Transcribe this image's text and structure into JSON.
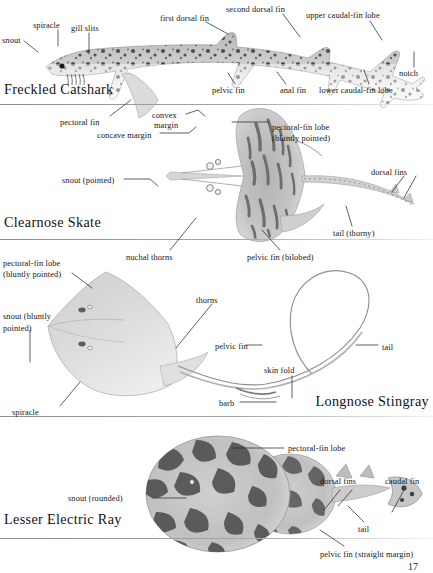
{
  "page": {
    "number": "17",
    "background": "#ffffff",
    "text_color": "#161616",
    "rule_color": "#9a9a9a"
  },
  "panels": [
    {
      "id": "freckled-catshark",
      "species_name": "Freckled Catshark",
      "labels": [
        {
          "text": "snout",
          "x": 2,
          "y": 36
        },
        {
          "text": "spiracle",
          "x": 33,
          "y": 21
        },
        {
          "text": "gill slits",
          "x": 71,
          "y": 24
        },
        {
          "text": "first dorsal fin",
          "x": 160,
          "y": 14
        },
        {
          "text": "second dorsal fin",
          "x": 226,
          "y": 5
        },
        {
          "text": "upper caudal-fin lobe",
          "x": 306,
          "y": 11
        },
        {
          "text": "notch",
          "x": 399,
          "y": 69
        },
        {
          "text": "lower caudal-fin lobe",
          "x": 319,
          "y": 86
        },
        {
          "text": "anal fin",
          "x": 280,
          "y": 86
        },
        {
          "text": "pelvic fin",
          "x": 212,
          "y": 86
        },
        {
          "text": "pectoral fin",
          "x": 60,
          "y": 118
        }
      ]
    },
    {
      "id": "clearnose-skate",
      "species_name": "Clearnose Skate",
      "labels": [
        {
          "text": "convex",
          "x": 152,
          "y": 111
        },
        {
          "text": "margin",
          "x": 154,
          "y": 121
        },
        {
          "text": "concave margin",
          "x": 97,
          "y": 131
        },
        {
          "text": "pectoral-fin lobe",
          "x": 272,
          "y": 123
        },
        {
          "text": "(bluntly pointed)",
          "x": 272,
          "y": 134
        },
        {
          "text": "dorsal fins",
          "x": 371,
          "y": 168
        },
        {
          "text": "snout (pointed)",
          "x": 62,
          "y": 176
        },
        {
          "text": "tail (thorny)",
          "x": 333,
          "y": 229
        },
        {
          "text": "pelvic fin (bilobed)",
          "x": 247,
          "y": 253
        },
        {
          "text": "nuchal thorns",
          "x": 126,
          "y": 253
        }
      ]
    },
    {
      "id": "longnose-stingray",
      "species_name": "Longnose Stingray",
      "labels": [
        {
          "text": "pectoral-fin lobe",
          "x": 3,
          "y": 259
        },
        {
          "text": "(bluntly pointed)",
          "x": 3,
          "y": 270
        },
        {
          "text": "thorns",
          "x": 196,
          "y": 296
        },
        {
          "text": "snout (bluntly",
          "x": 3,
          "y": 312
        },
        {
          "text": "pointed)",
          "x": 3,
          "y": 324
        },
        {
          "text": "pelvic fin",
          "x": 215,
          "y": 342
        },
        {
          "text": "tail",
          "x": 382,
          "y": 343
        },
        {
          "text": "skin fold",
          "x": 264,
          "y": 366
        },
        {
          "text": "barb",
          "x": 219,
          "y": 399
        },
        {
          "text": "spiracle",
          "x": 12,
          "y": 408
        }
      ]
    },
    {
      "id": "lesser-electric-ray",
      "species_name": "Lesser Electric Ray",
      "labels": [
        {
          "text": "pectoral-fin lobe",
          "x": 288,
          "y": 444
        },
        {
          "text": "dorsal fins",
          "x": 320,
          "y": 477
        },
        {
          "text": "caudal fin",
          "x": 385,
          "y": 477
        },
        {
          "text": "snout (rounded)",
          "x": 68,
          "y": 494
        },
        {
          "text": "tail",
          "x": 358,
          "y": 525
        },
        {
          "text": "pelvic fin (straight margin)",
          "x": 320,
          "y": 550
        }
      ]
    }
  ]
}
